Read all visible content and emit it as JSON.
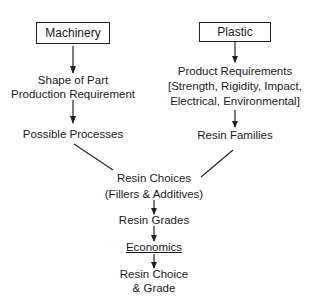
{
  "diagram": {
    "left_branch": {
      "start": "Machinery",
      "step1_line1": "Shape of Part",
      "step1_line2": "Production Requirement",
      "step2": "Possible Processes"
    },
    "right_branch": {
      "start": "Plastic",
      "step1_line1": "Product Requirements",
      "step1_line2": "[Strength, Rigidity, Impact,",
      "step1_line3": "Electrical, Environmental]",
      "step2": "Resin Families"
    },
    "merged": {
      "choices_line1": "Resin Choices",
      "choices_line2": "(Fillers & Additives)",
      "grades": "Resin Grades",
      "economics": "Economics",
      "result_line1": "Resin Choice",
      "result_line2": "& Grade"
    }
  }
}
